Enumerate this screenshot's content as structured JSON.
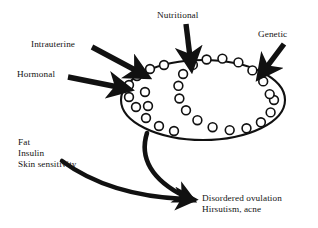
{
  "diagram": {
    "type": "concept-flow",
    "background_color": "#ffffff",
    "stroke_color": "#111111",
    "center_node": {
      "name": "polycystic-ovary",
      "shape": "ellipse",
      "label": "",
      "follicle_count": 20,
      "center_x": 203,
      "center_y": 100,
      "radius_x": 82,
      "radius_y": 40
    },
    "inputs": [
      {
        "id": "intrauterine",
        "label": "Intrauterine",
        "arrow": "diagonal-down-right"
      },
      {
        "id": "hormonal",
        "label": "Hormonal",
        "arrow": "right-down"
      },
      {
        "id": "nutritional",
        "label": "Nutritional",
        "arrow": "down"
      },
      {
        "id": "genetic",
        "label": "Genetic",
        "arrow": "diagonal-down-left"
      }
    ],
    "metabolic_factors": {
      "id": "metabolic",
      "lines": [
        "Fat",
        "Insulin",
        "Skin sensitivity"
      ],
      "text": "Fat\nInsulin\nSkin sensitivity",
      "arrow": "curved-down-right"
    },
    "outcome": {
      "id": "outcome",
      "lines": [
        "Disordered ovulation",
        "Hirsutism, acne"
      ],
      "text": "Disordered ovulation\nHirsutism, acne"
    },
    "connectors": [
      {
        "from": "intrauterine",
        "to": "polycystic-ovary",
        "style": "thick-straight-arrow"
      },
      {
        "from": "hormonal",
        "to": "polycystic-ovary",
        "style": "thick-straight-arrow"
      },
      {
        "from": "nutritional",
        "to": "polycystic-ovary",
        "style": "thick-straight-arrow"
      },
      {
        "from": "genetic",
        "to": "polycystic-ovary",
        "style": "thick-straight-arrow"
      },
      {
        "from": "polycystic-ovary",
        "to": "outcome",
        "style": "thick-curved-arrow"
      },
      {
        "from": "metabolic",
        "to": "outcome",
        "style": "thick-curved-arrow"
      }
    ]
  }
}
